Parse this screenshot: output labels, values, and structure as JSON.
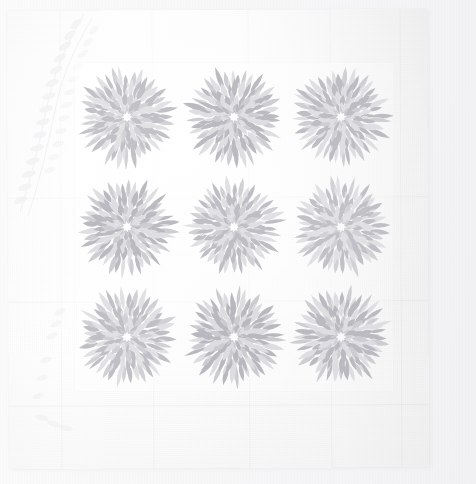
{
  "image": {
    "subject": "whitework quilt",
    "description": "Photograph of an all-white quilt with nine identical radiating star-burst medallion blocks arranged in a 3 by 3 grid on a plain white field with feathered vine quilting in the border",
    "orientation": "square",
    "width_px": 476,
    "height_px": 484
  },
  "palette": {
    "backdrop": "#f5f5f7",
    "cloth_light": "#ffffff",
    "cloth_base": "#fafafa",
    "cloth_shadow": "#f1f1f3",
    "motif_light": "#dcdce0",
    "motif_mid": "#c9c9ce",
    "motif_dark": "#b4b4bb",
    "quilting_line": "#e8e8ec"
  },
  "quilt": {
    "left": 8,
    "top": 10,
    "width": 420,
    "height": 458,
    "rotation_deg": -0.25,
    "seams_x": [
      60,
      152,
      248,
      330,
      400
    ],
    "folds_y": [
      196,
      300,
      404
    ]
  },
  "panel": {
    "left": 74,
    "top": 62,
    "width": 320,
    "height": 330,
    "rows": 3,
    "columns": 3
  },
  "motif": {
    "name": "starburst-medallion",
    "count": 9,
    "diameter_px": 96,
    "spike_rings": 4,
    "spikes_outer_ring": 40,
    "spikes_second_ring": 32,
    "spikes_third_ring": 24,
    "spikes_inner_ring": 16,
    "center_shape": "eight-point-star"
  },
  "medallions": [
    {
      "id": "block-1",
      "row": 1,
      "col": 1,
      "center_x": 127,
      "center_y": 117,
      "seed": 11
    },
    {
      "id": "block-2",
      "row": 1,
      "col": 2,
      "center_x": 234,
      "center_y": 117,
      "seed": 23
    },
    {
      "id": "block-3",
      "row": 1,
      "col": 3,
      "center_x": 341,
      "center_y": 117,
      "seed": 37
    },
    {
      "id": "block-4",
      "row": 2,
      "col": 1,
      "center_x": 127,
      "center_y": 227,
      "seed": 41
    },
    {
      "id": "block-5",
      "row": 2,
      "col": 2,
      "center_x": 234,
      "center_y": 227,
      "seed": 53
    },
    {
      "id": "block-6",
      "row": 2,
      "col": 3,
      "center_x": 341,
      "center_y": 227,
      "seed": 67
    },
    {
      "id": "block-7",
      "row": 3,
      "col": 1,
      "center_x": 127,
      "center_y": 337,
      "seed": 71
    },
    {
      "id": "block-8",
      "row": 3,
      "col": 2,
      "center_x": 234,
      "center_y": 337,
      "seed": 83
    },
    {
      "id": "block-9",
      "row": 3,
      "col": 3,
      "center_x": 341,
      "center_y": 337,
      "seed": 97
    }
  ],
  "border_quilting": {
    "pattern": "feathered vine",
    "location": "left border",
    "visible": true
  }
}
